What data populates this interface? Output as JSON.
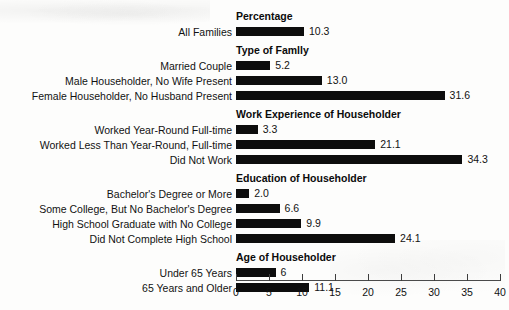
{
  "chart_data": {
    "type": "bar",
    "orientation": "horizontal",
    "title": "",
    "xlabel": "",
    "ylabel": "",
    "xlim": [
      0,
      40
    ],
    "xticks": [
      0,
      5,
      10,
      15,
      20,
      25,
      30,
      35,
      40
    ],
    "grid": false,
    "legend": null,
    "bar_color": "#0d0d0d",
    "sections": [
      {
        "header": "Percentage",
        "categories": [
          "All Families"
        ],
        "values": [
          10.3
        ],
        "value_labels": [
          "10.3"
        ]
      },
      {
        "header": "Type of Famlly",
        "categories": [
          "Married Couple",
          "Male Householder, No Wife Present",
          "Female Householder, No Husband Present"
        ],
        "values": [
          5.2,
          13.0,
          31.6
        ],
        "value_labels": [
          "5.2",
          "13.0",
          "31.6"
        ]
      },
      {
        "header": "Work Experience of Householder",
        "categories": [
          "Worked Year-Round Full-time",
          "Worked Less Than Year-Round, Full-time",
          "Did Not Work"
        ],
        "values": [
          3.3,
          21.1,
          34.3
        ],
        "value_labels": [
          "3.3",
          "21.1",
          "34.3"
        ]
      },
      {
        "header": "Education of Householder",
        "categories": [
          "Bachelor's Degree or More",
          "Some College, But No Bachelor's Degree",
          "High School Graduate with No College",
          "Did Not Complete High School"
        ],
        "values": [
          2.0,
          6.6,
          9.9,
          24.1
        ],
        "value_labels": [
          "2.0",
          "6.6",
          "9.9",
          "24.1"
        ]
      },
      {
        "header": "Age of Householder",
        "categories": [
          "Under 65 Years",
          "65 Years and Older"
        ],
        "values": [
          6.0,
          11.1
        ],
        "value_labels": [
          "6",
          "11.1"
        ]
      }
    ]
  }
}
